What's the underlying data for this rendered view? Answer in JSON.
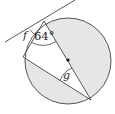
{
  "diagram": {
    "type": "circle-geometry",
    "labels": {
      "f": "f",
      "angle_64": "64°",
      "g": "g"
    },
    "colors": {
      "stroke": "#333333",
      "shade": "#e6e6e6",
      "background": "#ffffff"
    },
    "elements": {
      "circle": {
        "cx": 68,
        "cy": 61,
        "r": 43
      },
      "center_point": {
        "x": 68,
        "y": 60
      },
      "tangent_line": {
        "x1": 5,
        "y1": 42,
        "x2": 75,
        "y2": 0
      },
      "tangent_point": {
        "x": 44,
        "y": 21
      },
      "chord_end_left": {
        "x": 23,
        "y": 57
      },
      "diameter_end": {
        "x": 91,
        "y": 100
      }
    }
  }
}
